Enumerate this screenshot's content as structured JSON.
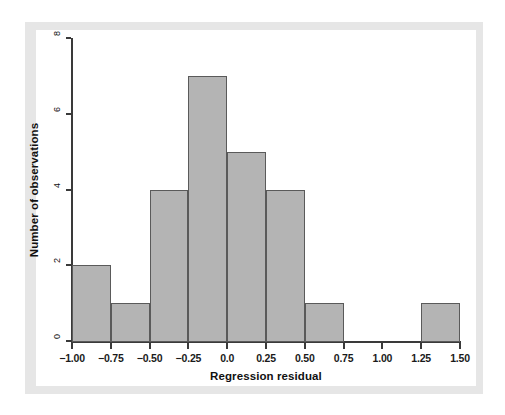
{
  "chart_data": {
    "type": "bar",
    "title": "",
    "subtitle": "",
    "xlabel": "Regression residual",
    "ylabel": "Number of observations",
    "xlim": [
      -1.0,
      1.5
    ],
    "ylim": [
      0,
      8
    ],
    "grid": false,
    "legend": null,
    "bin_width": 0.25,
    "x_ticks": [
      "-1.00",
      "-0.75",
      "-0.50",
      "-0.25",
      "0.0",
      "0.25",
      "0.50",
      "0.75",
      "1.00",
      "1.25",
      "1.50"
    ],
    "x_tick_values": [
      -1.0,
      -0.75,
      -0.5,
      -0.25,
      0.0,
      0.25,
      0.5,
      0.75,
      1.0,
      1.25,
      1.5
    ],
    "y_ticks": [
      "0",
      "2",
      "4",
      "6",
      "8"
    ],
    "y_tick_values": [
      0,
      2,
      4,
      6,
      8
    ],
    "bins": [
      {
        "left": -1.0,
        "right": -0.75,
        "count": 2
      },
      {
        "left": -0.75,
        "right": -0.5,
        "count": 1
      },
      {
        "left": -0.5,
        "right": -0.25,
        "count": 4
      },
      {
        "left": -0.25,
        "right": 0.0,
        "count": 7
      },
      {
        "left": 0.0,
        "right": 0.25,
        "count": 5
      },
      {
        "left": 0.25,
        "right": 0.5,
        "count": 4
      },
      {
        "left": 0.5,
        "right": 0.75,
        "count": 1
      },
      {
        "left": 0.75,
        "right": 1.0,
        "count": 0
      },
      {
        "left": 1.0,
        "right": 1.25,
        "count": 0
      },
      {
        "left": 1.25,
        "right": 1.5,
        "count": 1
      }
    ],
    "categories": [
      "-1.00 to -0.75",
      "-0.75 to -0.50",
      "-0.50 to -0.25",
      "-0.25 to 0.00",
      "0.00 to 0.25",
      "0.25 to 0.50",
      "0.50 to 0.75",
      "0.75 to 1.00",
      "1.00 to 1.25",
      "1.25 to 1.50"
    ],
    "values": [
      2,
      1,
      4,
      7,
      5,
      4,
      1,
      0,
      0,
      1
    ],
    "total_observations": 25,
    "colors": {
      "bar_fill": "#b4b4b4",
      "bar_edge": "#5a5a5a",
      "axis": "#3a3a3a",
      "panel_background": "#e6e6e6",
      "plot_background": "#ffffff",
      "text": "#111111"
    }
  }
}
